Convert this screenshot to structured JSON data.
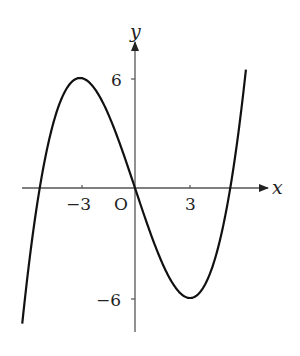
{
  "chart_data": {
    "type": "line",
    "title": "",
    "xlabel": "x",
    "ylabel": "y",
    "origin_label": "O",
    "x_ticks": [
      {
        "value": -3,
        "label": "−3"
      },
      {
        "value": 3,
        "label": "3"
      }
    ],
    "y_ticks": [
      {
        "value": 6,
        "label": "6"
      },
      {
        "value": -6,
        "label": "−6"
      }
    ],
    "grid": false,
    "legend": null,
    "function": "y = (x^3 - 27x)/9",
    "key_points": {
      "local_max": [
        -3,
        6
      ],
      "local_min": [
        3,
        -6
      ],
      "roots": [
        -5.2,
        0,
        5.2
      ]
    },
    "x": [
      -6.15,
      -5.2,
      -4.5,
      -4,
      -3,
      -2,
      -1,
      0,
      1,
      2,
      3,
      4,
      4.5,
      5.2,
      6.05
    ],
    "series": [
      {
        "name": "cubic",
        "values": [
          -7.4,
          0,
          3.38,
          4.89,
          6,
          5.11,
          2.89,
          0,
          -2.89,
          -5.11,
          -6,
          -4.89,
          -3.38,
          0,
          6.45
        ]
      }
    ],
    "xlim": [
      -6.15,
      6.05
    ],
    "ylim": [
      -7.4,
      6.45
    ],
    "colors": {
      "curve": "#111111",
      "axis": "#444444"
    }
  }
}
